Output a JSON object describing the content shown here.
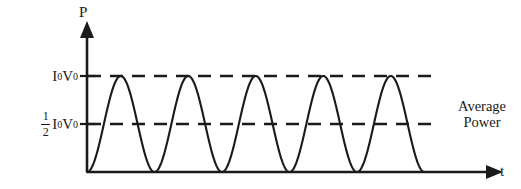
{
  "figure": {
    "title": "",
    "background_color": "#ffffff",
    "stroke_color": "#1a1a1a"
  },
  "axes": {
    "y_axis_label": "P",
    "x_axis_label": "t",
    "y_axis_name": "Power",
    "x_axis_name": "time"
  },
  "ticks": {
    "peak": {
      "symbol_i": "I",
      "symbol_i_sub": "0",
      "symbol_v": "V",
      "symbol_v_sub": "0",
      "text": "I0V0"
    },
    "half": {
      "frac_numerator": "1",
      "frac_denominator": "2",
      "symbol_i": "I",
      "symbol_i_sub": "0",
      "symbol_v": "V",
      "symbol_v_sub": "0",
      "text": "1/2 I0V0"
    }
  },
  "annotations": {
    "average_power_line1": "Average",
    "average_power_line2": "Power"
  },
  "chart_data": {
    "type": "line",
    "title": "",
    "xlabel": "t",
    "ylabel": "P",
    "grid": false,
    "legend": null,
    "xlim": [
      0,
      5
    ],
    "ylim": [
      0,
      1.12
    ],
    "x_tick_labels": [],
    "y_tick_labels": [
      "1/2 I0V0",
      "I0V0"
    ],
    "y_tick_values": [
      0.5,
      1.0
    ],
    "curve": {
      "name": "Instantaneous power P(t) = I0V0 sin^2(wt)",
      "formula": "P = I0*V0*sin^2(pi*t/T)",
      "amplitude": 1.0,
      "cycles": 5,
      "minimum": 0,
      "maximum": 1.0,
      "x": [
        0,
        0.125,
        0.25,
        0.375,
        0.5,
        0.625,
        0.75,
        0.875,
        1.0,
        1.125,
        1.25,
        1.375,
        1.5,
        1.625,
        1.75,
        1.875,
        2.0,
        2.125,
        2.25,
        2.375,
        2.5,
        2.625,
        2.75,
        2.875,
        3.0,
        3.125,
        3.25,
        3.375,
        3.5,
        3.625,
        3.75,
        3.875,
        4.0,
        4.125,
        4.25,
        4.375,
        4.5,
        4.625,
        4.75,
        4.875,
        5.0
      ],
      "y": [
        0,
        0.146,
        0.5,
        0.854,
        1.0,
        0.854,
        0.5,
        0.146,
        0,
        0.146,
        0.5,
        0.854,
        1.0,
        0.854,
        0.5,
        0.146,
        0,
        0.146,
        0.5,
        0.854,
        1.0,
        0.854,
        0.5,
        0.146,
        0,
        0.146,
        0.5,
        0.854,
        1.0,
        0.854,
        0.5,
        0.146,
        0,
        0.146,
        0.5,
        0.854,
        1.0,
        0.854,
        0.5,
        0.146,
        0
      ]
    },
    "reference_lines": [
      {
        "name": "peak-power-line",
        "label": "I0V0",
        "value": 1.0,
        "style": "dashed",
        "orientation": "horizontal"
      },
      {
        "name": "average-power-line",
        "label": "1/2 I0V0",
        "value": 0.5,
        "style": "dashed",
        "orientation": "horizontal",
        "annotation": "Average Power"
      }
    ]
  }
}
